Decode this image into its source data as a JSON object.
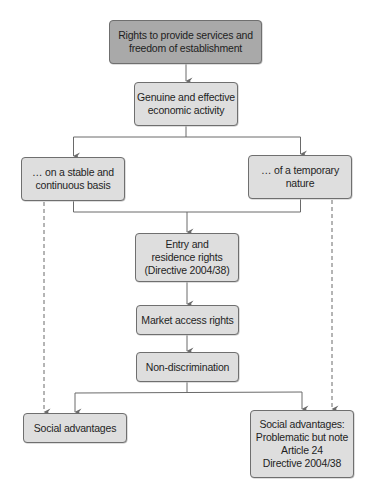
{
  "diagram": {
    "colors": {
      "root_fill": "#a9a9a9",
      "node_fill": "#dedede",
      "border": "#6f6f6f",
      "line": "#6a6a6a",
      "text": "#1e1e1e"
    },
    "nodes": {
      "root": {
        "label": "Rights to provide services and\nfreedom of establishment"
      },
      "economic_activity": {
        "label": "Genuine and effective\neconomic activity"
      },
      "stable_basis": {
        "label": "… on a stable and\ncontinuous basis"
      },
      "temporary_nature": {
        "label": "… of a temporary\nnature"
      },
      "entry_residence": {
        "label": "Entry and\nresidence rights\n(Directive 2004/38)"
      },
      "market_access": {
        "label": "Market access rights"
      },
      "non_discrimination": {
        "label": "Non-discrimination"
      },
      "social_advantages_left": {
        "label": "Social advantages"
      },
      "social_advantages_right": {
        "label": "Social advantages:\nProblematic but note\nArticle 24\nDirective 2004/38"
      }
    },
    "edges": [
      {
        "from": "root",
        "to": "economic_activity",
        "style": "solid"
      },
      {
        "from": "economic_activity",
        "to": "stable_basis",
        "style": "solid"
      },
      {
        "from": "economic_activity",
        "to": "temporary_nature",
        "style": "solid"
      },
      {
        "from": "stable_basis",
        "to": "entry_residence",
        "style": "solid"
      },
      {
        "from": "temporary_nature",
        "to": "entry_residence",
        "style": "solid"
      },
      {
        "from": "entry_residence",
        "to": "market_access",
        "style": "solid"
      },
      {
        "from": "market_access",
        "to": "non_discrimination",
        "style": "solid"
      },
      {
        "from": "non_discrimination",
        "to": "social_advantages_left",
        "style": "solid"
      },
      {
        "from": "non_discrimination",
        "to": "social_advantages_right",
        "style": "solid"
      },
      {
        "from": "stable_basis",
        "to": "social_advantages_left",
        "style": "dashed"
      },
      {
        "from": "temporary_nature",
        "to": "social_advantages_right",
        "style": "dashed"
      }
    ]
  }
}
